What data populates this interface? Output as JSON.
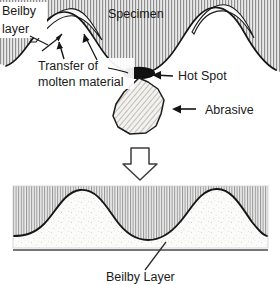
{
  "figure": {
    "title_text": "",
    "colors": {
      "hatch_gray": "#9a9a9a",
      "hatch_bg": "#e8e8e8",
      "outline": "#141414",
      "hot_spot": "#0d0d0d",
      "light_layer": "#f7f7f5",
      "abrasive_fill": "#f2f1ee",
      "abrasive_hatch": "#b5b2ad",
      "stipple": "#9c9c9c",
      "background": "#ffffff"
    }
  },
  "top_panel": {
    "labels": {
      "beilby_layer_line1": "Beilby",
      "beilby_layer_line2": "layer",
      "specimen": "Specimen",
      "transfer_line1": "Transfer of",
      "transfer_line2": "molten material",
      "hot_spot": "Hot Spot",
      "abrasive": "Abrasive"
    },
    "icons": {
      "beilby_leader": "leader-line-icon",
      "transfer_arrow_left": "arrow-up-icon",
      "transfer_arrow_right": "arrow-up-icon",
      "hot_spot_arrow": "arrow-left-icon",
      "abrasive_arrow": "arrow-left-icon"
    }
  },
  "transition": {
    "arrow_icon": "block-arrow-down-icon",
    "direction": "down"
  },
  "bottom_panel": {
    "labels": {
      "beilby_layer": "Beilby Layer"
    },
    "icons": {
      "beilby_leader": "leader-line-icon"
    }
  }
}
